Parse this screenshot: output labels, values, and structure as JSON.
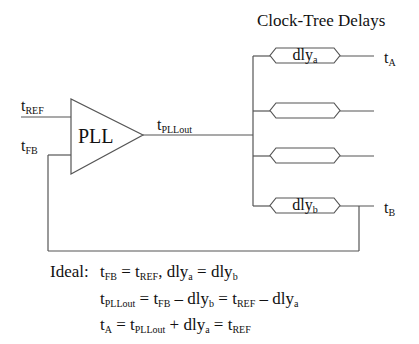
{
  "title": "Clock-Tree Delays",
  "pll": {
    "label": "PLL"
  },
  "signals": {
    "t_ref": {
      "base": "t",
      "sub": "REF"
    },
    "t_fb": {
      "base": "t",
      "sub": "FB"
    },
    "t_pllout": {
      "base": "t",
      "sub": "PLLout"
    },
    "t_a": {
      "base": "t",
      "sub": "A"
    },
    "t_b": {
      "base": "t",
      "sub": "B"
    }
  },
  "delays": [
    {
      "base": "dly",
      "sub": "a"
    },
    {
      "base": "",
      "sub": ""
    },
    {
      "base": "",
      "sub": ""
    },
    {
      "base": "dly",
      "sub": "b"
    }
  ],
  "equations": {
    "ideal_label": "Ideal:",
    "line1": [
      {
        "t": "t"
      },
      {
        "s": "FB"
      },
      {
        "t": " = t"
      },
      {
        "s": "REF"
      },
      {
        "t": ", dly"
      },
      {
        "s": "a"
      },
      {
        "t": " = dly"
      },
      {
        "s": "b"
      }
    ],
    "line2": [
      {
        "t": "t"
      },
      {
        "s": "PLLout"
      },
      {
        "t": " = t"
      },
      {
        "s": "FB"
      },
      {
        "t": " – dly"
      },
      {
        "s": "b"
      },
      {
        "t": " = t"
      },
      {
        "s": "REF"
      },
      {
        "t": " – dly"
      },
      {
        "s": "a"
      }
    ],
    "line3": [
      {
        "t": "t"
      },
      {
        "s": "A"
      },
      {
        "t": " = t"
      },
      {
        "s": "PLLout"
      },
      {
        "t": " + dly"
      },
      {
        "s": "a"
      },
      {
        "t": " = t"
      },
      {
        "s": "REF"
      }
    ]
  },
  "colors": {
    "line": "#555555",
    "text": "#111111"
  }
}
